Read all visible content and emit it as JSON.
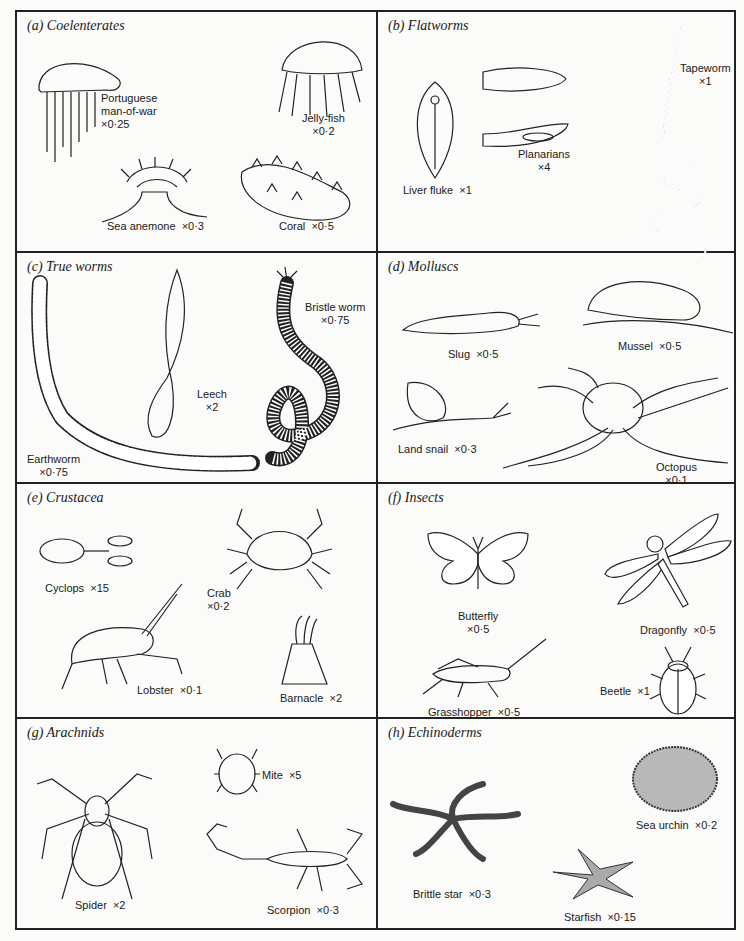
{
  "panels": [
    {
      "id": "a",
      "title": "(a) Coelenterates",
      "specimens": [
        {
          "name": "Portuguese",
          "name2": "man-of-war",
          "scale": "×0·25"
        },
        {
          "name": "Jelly-fish",
          "scale": "×0·2"
        },
        {
          "name": "Sea anemone",
          "scale": "×0·3"
        },
        {
          "name": "Coral",
          "scale": "×0·5"
        }
      ]
    },
    {
      "id": "b",
      "title": "(b) Flatworms",
      "specimens": [
        {
          "name": "Liver fluke",
          "scale": "×1"
        },
        {
          "name": "Planarians",
          "scale": "×4"
        },
        {
          "name": "Tapeworm",
          "scale": "×1"
        }
      ]
    },
    {
      "id": "c",
      "title": "(c) True worms",
      "specimens": [
        {
          "name": "Earthworm",
          "scale": "×0·75"
        },
        {
          "name": "Leech",
          "scale": "×2"
        },
        {
          "name": "Bristle worm",
          "scale": "×0·75"
        }
      ]
    },
    {
      "id": "d",
      "title": "(d) Molluscs",
      "specimens": [
        {
          "name": "Slug",
          "scale": "×0·5"
        },
        {
          "name": "Mussel",
          "scale": "×0·5"
        },
        {
          "name": "Land snail",
          "scale": "×0·3"
        },
        {
          "name": "Octopus",
          "scale": "×0·1"
        }
      ]
    },
    {
      "id": "e",
      "title": "(e) Crustacea",
      "specimens": [
        {
          "name": "Cyclops",
          "scale": "×15"
        },
        {
          "name": "Crab",
          "scale": "×0·2"
        },
        {
          "name": "Lobster",
          "scale": "×0·1"
        },
        {
          "name": "Barnacle",
          "scale": "×2"
        }
      ]
    },
    {
      "id": "f",
      "title": "(f) Insects",
      "specimens": [
        {
          "name": "Butterfly",
          "scale": "×0·5"
        },
        {
          "name": "Dragonfly",
          "scale": "×0·5"
        },
        {
          "name": "Grasshopper",
          "scale": "×0·5"
        },
        {
          "name": "Beetle",
          "scale": "×1"
        }
      ]
    },
    {
      "id": "g",
      "title": "(g) Arachnids",
      "specimens": [
        {
          "name": "Mite",
          "scale": "×5"
        },
        {
          "name": "Spider",
          "scale": "×2"
        },
        {
          "name": "Scorpion",
          "scale": "×0·3"
        }
      ]
    },
    {
      "id": "h",
      "title": "(h) Echinoderms",
      "specimens": [
        {
          "name": "Sea urchin",
          "scale": "×0·2"
        },
        {
          "name": "Brittle star",
          "scale": "×0·3"
        },
        {
          "name": "Starfish",
          "scale": "×0·15"
        }
      ]
    }
  ]
}
